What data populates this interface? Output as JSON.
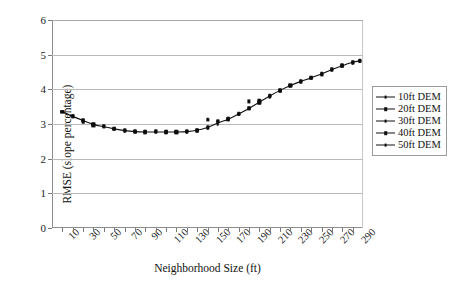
{
  "chart_data": {
    "type": "scatter",
    "title": "",
    "xlabel": "Neighborhood Size (ft)",
    "ylabel": "RMSE (slope percentage)",
    "xlim": [
      0,
      300
    ],
    "ylim": [
      0,
      6
    ],
    "ytick_values": [
      0,
      1,
      2,
      3,
      4,
      5,
      6
    ],
    "ytick_labels": [
      "0",
      "1",
      "2",
      "3",
      "4",
      "5",
      "6"
    ],
    "xtick_values": [
      10,
      20,
      30,
      40,
      50,
      60,
      70,
      80,
      90,
      100,
      110,
      120,
      130,
      140,
      150,
      160,
      170,
      180,
      190,
      200,
      210,
      220,
      230,
      240,
      250,
      260,
      270,
      280,
      290
    ],
    "xtick_labels": [
      "10",
      "",
      "30",
      "",
      "50",
      "",
      "70",
      "",
      "90",
      "",
      "110",
      "",
      "130",
      "",
      "150",
      "",
      "170",
      "",
      "190",
      "",
      "210",
      "",
      "230",
      "",
      "250",
      "",
      "270",
      "",
      "290"
    ],
    "grid": true,
    "legend_position": "right",
    "legend": [
      "10ft DEM",
      "20ft DEM",
      "30ft DEM",
      "40ft DEM",
      "50ft DEM"
    ],
    "x": [
      10,
      20,
      30,
      40,
      50,
      60,
      70,
      80,
      90,
      100,
      110,
      120,
      130,
      140,
      150,
      160,
      170,
      180,
      190,
      200,
      210,
      220,
      230,
      240,
      250,
      260,
      270,
      280,
      290,
      297
    ],
    "series": [
      {
        "name": "10ft DEM",
        "values": [
          3.35,
          3.21,
          3.12,
          3.0,
          2.92,
          2.85,
          2.8,
          2.77,
          2.76,
          2.76,
          2.76,
          2.76,
          2.77,
          2.8,
          2.88,
          3.0,
          3.12,
          3.27,
          3.44,
          3.6,
          3.78,
          3.95,
          4.09,
          4.2,
          4.31,
          4.42,
          4.55,
          4.66,
          4.76,
          4.8
        ]
      },
      {
        "name": "20ft DEM",
        "values": [
          3.35,
          3.22,
          3.08,
          2.96,
          2.92,
          2.86,
          2.8,
          2.77,
          2.76,
          2.77,
          2.76,
          2.76,
          2.78,
          2.81,
          2.9,
          3.05,
          3.13,
          3.28,
          3.45,
          3.62,
          3.8,
          3.96,
          4.1,
          4.22,
          4.32,
          4.43,
          4.56,
          4.67,
          4.77,
          4.81
        ]
      },
      {
        "name": "30ft DEM",
        "values": [
          3.35,
          3.22,
          3.1,
          2.98,
          2.93,
          2.86,
          2.81,
          2.78,
          2.77,
          2.78,
          2.77,
          2.77,
          2.78,
          2.82,
          2.92,
          3.06,
          3.14,
          3.29,
          3.46,
          3.64,
          3.81,
          3.97,
          4.11,
          4.23,
          4.33,
          4.44,
          4.57,
          4.68,
          4.78,
          4.82
        ]
      },
      {
        "name": "40ft DEM",
        "values": [
          3.35,
          3.23,
          3.11,
          2.99,
          2.94,
          2.87,
          2.82,
          2.79,
          2.78,
          2.79,
          2.78,
          2.78,
          2.79,
          2.83,
          3.12,
          3.08,
          3.15,
          3.3,
          3.65,
          3.66,
          3.82,
          3.98,
          4.12,
          4.24,
          4.34,
          4.45,
          4.58,
          4.69,
          4.79,
          4.83
        ]
      },
      {
        "name": "50ft DEM",
        "values": [
          3.35,
          3.23,
          3.06,
          3.0,
          2.95,
          2.88,
          2.83,
          2.8,
          2.79,
          2.8,
          2.79,
          2.79,
          2.8,
          2.84,
          3.13,
          3.09,
          3.16,
          3.31,
          3.47,
          3.68,
          3.83,
          3.99,
          4.13,
          4.25,
          4.35,
          4.46,
          4.59,
          4.7,
          4.8,
          4.84
        ]
      }
    ],
    "trend_values": [
      3.35,
      3.22,
      3.1,
      2.99,
      2.92,
      2.86,
      2.81,
      2.78,
      2.77,
      2.77,
      2.77,
      2.77,
      2.78,
      2.82,
      2.9,
      3.03,
      3.14,
      3.29,
      3.45,
      3.63,
      3.81,
      3.97,
      4.11,
      4.23,
      4.33,
      4.44,
      4.57,
      4.68,
      4.78,
      4.82
    ]
  }
}
